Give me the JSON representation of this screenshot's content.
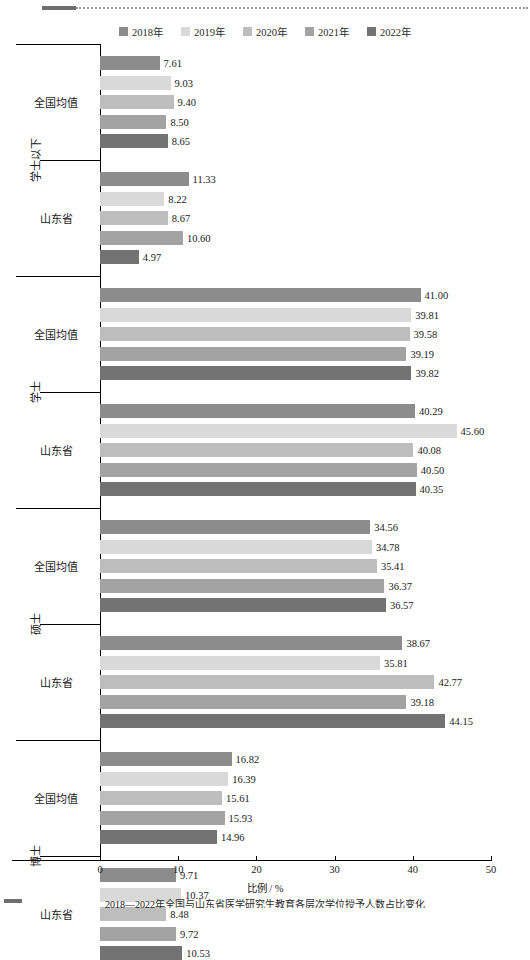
{
  "legend": {
    "position": "top-center",
    "entries": [
      {
        "label": "2018年",
        "color": "#8c8c8c"
      },
      {
        "label": "2019年",
        "color": "#d9d9d9"
      },
      {
        "label": "2020年",
        "color": "#bdbdbd"
      },
      {
        "label": "2021年",
        "color": "#a3a3a3"
      },
      {
        "label": "2022年",
        "color": "#737373"
      }
    ]
  },
  "axis": {
    "xlabel": "比例 / %",
    "ticks": [
      "0",
      "10",
      "20",
      "30",
      "40",
      "50"
    ],
    "xmin": 0,
    "xmax": 50
  },
  "caption": {
    "text": "2018—2022年全国与山东省医学研究生教育各层次学位授予人数占比变化"
  },
  "groups": [
    {
      "name": "学士以下",
      "categories": [
        {
          "label": "全国均值",
          "values": [
            "7.61",
            "9.03",
            "9.40",
            "8.50",
            "8.65"
          ]
        },
        {
          "label": "山东省",
          "values": [
            "11.33",
            "8.22",
            "8.67",
            "10.60",
            "4.97"
          ]
        }
      ]
    },
    {
      "name": "学士",
      "categories": [
        {
          "label": "全国均值",
          "values": [
            "41.00",
            "39.81",
            "39.58",
            "39.19",
            "39.82"
          ]
        },
        {
          "label": "山东省",
          "values": [
            "40.29",
            "45.60",
            "40.08",
            "40.50",
            "40.35"
          ]
        }
      ]
    },
    {
      "name": "硕士",
      "categories": [
        {
          "label": "全国均值",
          "values": [
            "34.56",
            "34.78",
            "35.41",
            "36.37",
            "36.57"
          ]
        },
        {
          "label": "山东省",
          "values": [
            "38.67",
            "35.81",
            "42.77",
            "39.18",
            "44.15"
          ]
        }
      ]
    },
    {
      "name": "博士",
      "categories": [
        {
          "label": "全国均值",
          "values": [
            "16.82",
            "16.39",
            "15.61",
            "15.93",
            "14.96"
          ]
        },
        {
          "label": "山东省",
          "values": [
            "9.71",
            "10.37",
            "8.48",
            "9.72",
            "10.53"
          ]
        }
      ]
    }
  ],
  "chart_data": {
    "type": "bar",
    "orientation": "horizontal",
    "title": "",
    "xlabel": "比例 / %",
    "ylabel": "",
    "xlim": [
      0,
      50
    ],
    "xticks": [
      0,
      10,
      20,
      30,
      40,
      50
    ],
    "grid": false,
    "legend_position": "top-center",
    "categories": [
      "学士以下 / 全国均值",
      "学士以下 / 山东省",
      "学士 / 全国均值",
      "学士 / 山东省",
      "硕士 / 全国均值",
      "硕士 / 山东省",
      "博士 / 全国均值",
      "博士 / 山东省"
    ],
    "series": [
      {
        "name": "2018年",
        "color": "#8c8c8c",
        "values": [
          7.61,
          11.33,
          41.0,
          40.29,
          34.56,
          38.67,
          16.82,
          9.71
        ]
      },
      {
        "name": "2019年",
        "color": "#d9d9d9",
        "values": [
          9.03,
          8.22,
          39.81,
          45.6,
          34.78,
          35.81,
          16.39,
          10.37
        ]
      },
      {
        "name": "2020年",
        "color": "#bdbdbd",
        "values": [
          9.4,
          8.67,
          39.58,
          40.08,
          35.41,
          42.77,
          15.61,
          8.48
        ]
      },
      {
        "name": "2021年",
        "color": "#a3a3a3",
        "values": [
          8.5,
          10.6,
          39.19,
          40.5,
          36.37,
          39.18,
          15.93,
          9.72
        ]
      },
      {
        "name": "2022年",
        "color": "#737373",
        "values": [
          8.65,
          4.97,
          39.82,
          40.35,
          36.57,
          44.15,
          14.96,
          10.53
        ]
      }
    ]
  }
}
